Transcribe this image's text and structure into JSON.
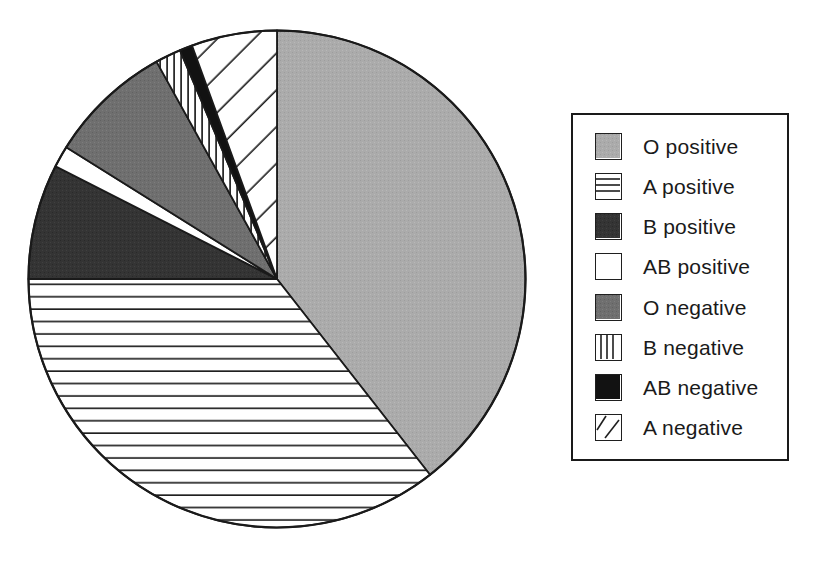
{
  "chart_data": {
    "type": "pie",
    "title": "",
    "subtitle": "",
    "xlabel": "",
    "ylabel": "",
    "legend_position": "right",
    "grid": false,
    "start_angle_deg": 0,
    "direction": "clockwise",
    "categories": [
      "O positive",
      "A positive",
      "B positive",
      "AB positive",
      "O negative",
      "B negative",
      "AB negative",
      "A negative"
    ],
    "values": [
      39.5,
      35.5,
      7.5,
      1.4,
      8.0,
      1.7,
      0.8,
      5.6
    ],
    "slices": [
      {
        "label": "O positive",
        "value": 39.5,
        "start_deg": 0,
        "end_deg": 142,
        "pattern": "solid-light-gray",
        "color": "#a8a8a8"
      },
      {
        "label": "A positive",
        "value": 35.5,
        "start_deg": 142,
        "end_deg": 270,
        "pattern": "horizontal-lines",
        "color": "#ffffff"
      },
      {
        "label": "B positive",
        "value": 7.5,
        "start_deg": 270,
        "end_deg": 297,
        "pattern": "solid-dark-gray",
        "color": "#3a3a3a"
      },
      {
        "label": "AB positive",
        "value": 1.4,
        "start_deg": 297,
        "end_deg": 302,
        "pattern": "solid-white",
        "color": "#ffffff"
      },
      {
        "label": "O negative",
        "value": 8.0,
        "start_deg": 302,
        "end_deg": 331,
        "pattern": "solid-medium-gray",
        "color": "#707070"
      },
      {
        "label": "B negative",
        "value": 1.7,
        "start_deg": 331,
        "end_deg": 337,
        "pattern": "vertical-lines",
        "color": "#ffffff"
      },
      {
        "label": "AB negative",
        "value": 0.8,
        "start_deg": 337,
        "end_deg": 340,
        "pattern": "solid-black",
        "color": "#121212"
      },
      {
        "label": "A negative",
        "value": 5.6,
        "start_deg": 340,
        "end_deg": 360,
        "pattern": "diagonal-lines",
        "color": "#ffffff"
      }
    ]
  },
  "legend": {
    "items": [
      {
        "label": "O positive",
        "swatch": "swatch-solid-light-gray"
      },
      {
        "label": "A positive",
        "swatch": "swatch-horizontal-lines"
      },
      {
        "label": "B positive",
        "swatch": "swatch-solid-dark-gray"
      },
      {
        "label": "AB positive",
        "swatch": "swatch-solid-white"
      },
      {
        "label": "O negative",
        "swatch": "swatch-solid-medium-gray"
      },
      {
        "label": "B negative",
        "swatch": "swatch-vertical-lines"
      },
      {
        "label": "AB negative",
        "swatch": "swatch-solid-black"
      },
      {
        "label": "A negative",
        "swatch": "swatch-diagonal-lines"
      }
    ]
  },
  "palette": {
    "outline": "#1a1a1a",
    "light_gray": "#a8a8a8",
    "medium_gray": "#707070",
    "dark_gray": "#3a3a3a",
    "black": "#121212",
    "white": "#ffffff",
    "background": "#ffffff"
  }
}
